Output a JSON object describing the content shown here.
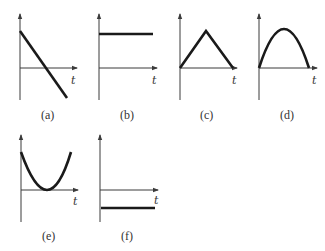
{
  "figure": {
    "axis_variable": "t",
    "panels": [
      {
        "id": "a",
        "label": "(a)",
        "shape": "straight line decreasing, crossing t-axis"
      },
      {
        "id": "b",
        "label": "(b)",
        "shape": "constant positive horizontal line"
      },
      {
        "id": "c",
        "label": "(c)",
        "shape": "triangle rising then falling to zero"
      },
      {
        "id": "d",
        "label": "(d)",
        "shape": "downward parabola arc from zero to zero"
      },
      {
        "id": "e",
        "label": "(e)",
        "shape": "upward parabola touching t-axis at minimum"
      },
      {
        "id": "f",
        "label": "(f)",
        "shape": "constant negative horizontal line"
      }
    ]
  }
}
